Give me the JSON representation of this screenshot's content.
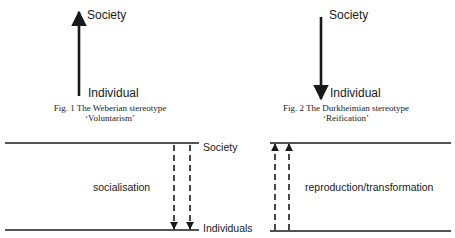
{
  "fig1": {
    "top_label": "Society",
    "bottom_label": "Individual",
    "arrow_direction": "up",
    "caption_line1": "Fig. 1 The Weberian stereotype",
    "caption_line2": "‘Voluntarism’"
  },
  "fig2": {
    "top_label": "Society",
    "bottom_label": "Individual",
    "arrow_direction": "down",
    "caption_line1": "Fig. 2 The Durkheimian stereotype",
    "caption_line2": "‘Reification’"
  },
  "fig3": {
    "top_label": "Society",
    "bottom_label": "Individuals",
    "left_process_label": "socialisation",
    "left_arrows_direction": "down",
    "right_process_label": "reproduction/transformation",
    "right_arrows_direction": "up"
  },
  "colors": {
    "ink": "#1a1a1a",
    "background": "#ffffff"
  }
}
